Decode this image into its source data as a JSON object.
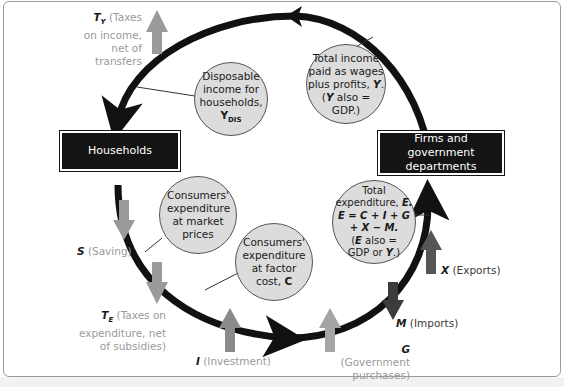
{
  "diagram": {
    "boxes": {
      "households": "Households",
      "firms": "Firms and government departments"
    },
    "bubbles": {
      "disposable_income": {
        "text": "Disposable income for households,",
        "symbol": "Y",
        "subscript": "DIS"
      },
      "total_income": {
        "line1": "Total income",
        "line2": "paid as wages",
        "line3": "plus profits,",
        "sym1": "Y",
        "line4": "(",
        "sym2": "Y",
        "line5": "also =",
        "line6": "GDP.)"
      },
      "consumers_market": {
        "text": "Consumers' expenditure at market prices"
      },
      "consumers_factor": {
        "text": "Consumers' expenditure at factor cost,",
        "symbol": "C"
      },
      "total_expenditure": {
        "line1": "Total",
        "line2": "expenditure,",
        "sym1": "E.",
        "eq1": "E = C + I + G",
        "eq2": "+ X − M.",
        "line3": "(",
        "sym2": "E",
        "line4": "also =",
        "line5": "GDP or",
        "sym3": "Y",
        "line6": ".)"
      }
    },
    "flows": {
      "taxes_income": {
        "symbol": "T",
        "subscript": "Y",
        "text": "(Taxes on income, net of transfers",
        "direction": "out",
        "color": "#9a9a9a"
      },
      "saving": {
        "symbol": "S",
        "text": "(Saving)",
        "direction": "out",
        "color": "#9a9a9a"
      },
      "taxes_expenditure": {
        "symbol": "T",
        "subscript": "E",
        "text": "(Taxes on expenditure, net of subsidies)",
        "direction": "out",
        "color": "#9a9a9a"
      },
      "investment": {
        "symbol": "I",
        "text": "(Investment)",
        "direction": "in",
        "color": "#8a8a8a"
      },
      "government": {
        "symbol": "G",
        "text": "(Government purchases)",
        "direction": "in",
        "color": "#a5a5a5"
      },
      "imports": {
        "symbol": "M",
        "text": "(Imports)",
        "direction": "out",
        "color": "#3c3c3c"
      },
      "exports": {
        "symbol": "X",
        "text": "(Exports)",
        "direction": "in",
        "color": "#555555"
      }
    },
    "colors": {
      "circuit": "#111111",
      "box_fill": "#141414",
      "bubble_fill": "#dcdcdc",
      "leak_grey": "#9a9a9a",
      "inject_dark": "#4a4a4a"
    }
  }
}
